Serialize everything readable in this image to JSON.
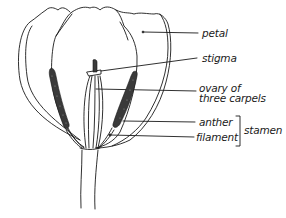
{
  "diagram": {
    "colors": {
      "line": "#1a1a1a",
      "anther_fill": "#3a3a3a",
      "background": "#ffffff"
    },
    "labels": {
      "petal": "petal",
      "stigma": "stigma",
      "ovary": "ovary of\nthree carpels",
      "anther": "anther",
      "filament": "filament",
      "stamen": "stamen"
    },
    "groups": {
      "stamen": [
        "anther",
        "filament"
      ]
    }
  }
}
